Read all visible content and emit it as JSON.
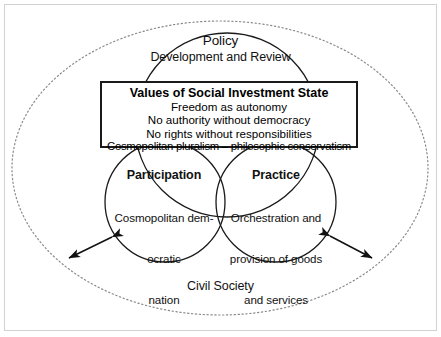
{
  "diagram": {
    "title_visible": false,
    "outer_region": {
      "label": "Civil Society",
      "shape": "dotted-ellipse"
    },
    "frame": {
      "shape": "rectangle",
      "color": "#cfcfcf"
    },
    "circles": [
      {
        "id": "policy",
        "position": "top",
        "title": "Policy",
        "body": "Development and Review"
      },
      {
        "id": "participation",
        "position": "bottom-left",
        "title": "Participation",
        "body_lines": [
          "Cosmopolitan dem-",
          "ocratic",
          "nation"
        ]
      },
      {
        "id": "practice",
        "position": "bottom-right",
        "title": "Practice",
        "body_lines": [
          "Orchestration and",
          "provision of goods",
          "and services"
        ]
      }
    ],
    "center_box": {
      "title": "Values of Social Investment State",
      "lines": [
        "Freedom as autonomy",
        "No authority without democracy",
        "No rights without responsibilities",
        "Cosmopolitan pluralism – philosophic conservatism"
      ],
      "border_color": "#1a1a1a"
    },
    "arrows": [
      {
        "id": "arrow-left",
        "style": "double-headed",
        "direction": "down-left"
      },
      {
        "id": "arrow-right",
        "style": "double-headed",
        "direction": "down-right"
      }
    ],
    "stroke_color": "#1a1a1a",
    "dotted_color": "#8a8a8a"
  }
}
